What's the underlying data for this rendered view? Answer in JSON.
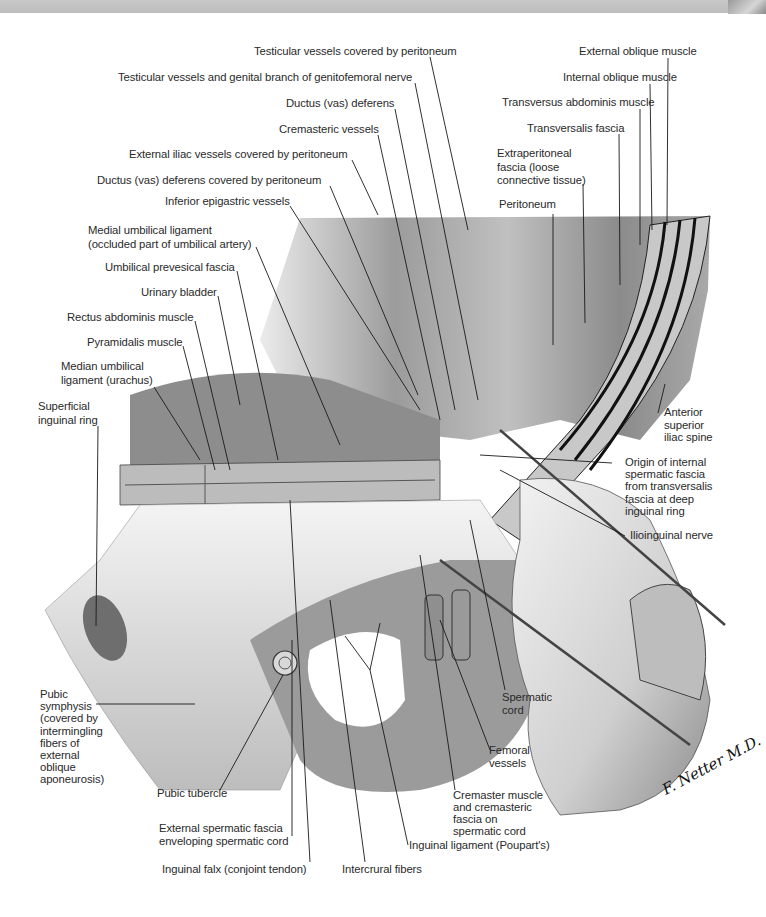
{
  "figure": {
    "signature": "F. Netter M.D.",
    "colors": {
      "background": "#ffffff",
      "ink": "#2a2a2a",
      "leader_line": "#1a1a1a",
      "topbar": "#c4c4c4"
    }
  },
  "labels": {
    "top": [
      "Testicular vessels covered by peritoneum",
      "Testicular vessels and genital branch of genitofemoral nerve",
      "Ductus (vas) deferens",
      "Cremasteric vessels",
      "External iliac vessels covered by peritoneum",
      "Ductus (vas) deferens covered by peritoneum",
      "Inferior epigastric vessels"
    ],
    "top_right": [
      "External oblique muscle",
      "Internal oblique muscle",
      "Transversus abdominis muscle",
      "Transversalis fascia",
      "Extraperitoneal\nfascia (loose\nconnective tissue)",
      "Peritoneum"
    ],
    "left": [
      "Medial umbilical ligament\n(occluded part of umbilical artery)",
      "Umbilical prevesical fascia",
      "Urinary bladder",
      "Rectus abdominis muscle",
      "Pyramidalis muscle",
      "Median umbilical\nligament (urachus)",
      "Superficial\ninguinal ring",
      "Pubic\nsymphysis\n(covered by\nintermingling\nfibers of\nexternal\noblique\naponeurosis)"
    ],
    "right": [
      "Anterior\nsuperior\niliac spine",
      "Origin of internal\nspermatic fascia\nfrom transversalis\nfascia at deep\ninguinal ring",
      "Ilioinguinal nerve",
      "Spermatic\ncord",
      "Femoral\nvessels",
      "Cremaster muscle\nand cremasteric\nfascia on\nspermatic cord"
    ],
    "bottom": [
      "Pubic tubercle",
      "External spermatic fascia\nenveloping spermatic cord",
      "Inguinal ligament (Poupart's)",
      "Inguinal falx (conjoint tendon)",
      "Intercrural fibers"
    ]
  }
}
